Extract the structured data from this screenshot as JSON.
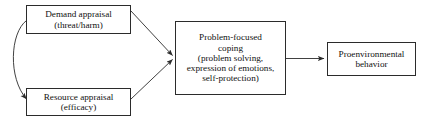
{
  "diagram": {
    "background_color": "#ffffff",
    "stroke_color": "#2b2b2b",
    "text_color": "#111111",
    "nodes": [
      {
        "id": "demand-appraisal",
        "label": "Demand appraisal\n(threat/harm)",
        "shape": "rectangle"
      },
      {
        "id": "resource-appraisal",
        "label": "Resource appraisal\n(efficacy)",
        "shape": "rectangle"
      },
      {
        "id": "problem-focused-coping",
        "label": "Problem-focused\ncoping\n(problem solving,\nexpression of emotions,\nself-protection)",
        "shape": "rectangle"
      },
      {
        "id": "proenvironmental-behavior",
        "label": "Proenvironmental\nbehavior",
        "shape": "rectangle"
      }
    ],
    "edges": [
      {
        "id": "demand-to-coping",
        "from": "demand-appraisal",
        "to": "problem-focused-coping",
        "style": "straight",
        "arrowheads": "end"
      },
      {
        "id": "resource-to-coping",
        "from": "resource-appraisal",
        "to": "problem-focused-coping",
        "style": "straight",
        "arrowheads": "end"
      },
      {
        "id": "coping-to-behavior",
        "from": "problem-focused-coping",
        "to": "proenvironmental-behavior",
        "style": "straight",
        "arrowheads": "end"
      },
      {
        "id": "demand-resource-bidirectional",
        "from": "demand-appraisal",
        "to": "resource-appraisal",
        "style": "curved",
        "arrowheads": "both"
      }
    ]
  }
}
